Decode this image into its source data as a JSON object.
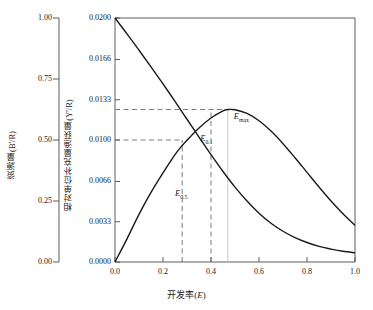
{
  "chart_data": {
    "type": "line",
    "title": "",
    "xlabel": "开发率(E)",
    "xlabel_plain": "开发率",
    "xlabel_symbol": "E",
    "ylabel_left": "资源量(B'/R)",
    "ylabel_right": "相对单位补充量渔获量(Y'/R)",
    "xlim": [
      0.0,
      1.0
    ],
    "ylim_left": [
      0.0,
      1.0
    ],
    "ylim_right": [
      0.0,
      0.02
    ],
    "xticks": [
      "0.0",
      "0.2",
      "0.4",
      "0.6",
      "0.8",
      "1.0"
    ],
    "xtick_values": [
      0.0,
      0.2,
      0.4,
      0.6,
      0.8,
      1.0
    ],
    "yticks_left": [
      "1.00",
      "0.75",
      "0.50",
      "0.25",
      "0.00"
    ],
    "ytick_values_left": [
      1.0,
      0.75,
      0.5,
      0.25,
      0.0
    ],
    "yticks_right": [
      "0.0200",
      "0.0166",
      "0.0133",
      "0.0100",
      "0.0066",
      "0.0033",
      "0.0000"
    ],
    "ytick_values_right": [
      0.02,
      0.0166,
      0.0133,
      0.01,
      0.0066,
      0.0033,
      0.0
    ],
    "grid": false,
    "legend": "none",
    "series": [
      {
        "name": "资源量(B'/R)",
        "axis": "left",
        "style": "solid",
        "color": "#1a1a1a",
        "x": [
          0.0,
          0.05,
          0.1,
          0.15,
          0.2,
          0.25,
          0.28,
          0.3,
          0.35,
          0.4,
          0.45,
          0.5,
          0.55,
          0.6,
          0.65,
          0.7,
          0.75,
          0.8,
          0.85,
          0.9,
          0.95,
          1.0
        ],
        "values": [
          1.0,
          0.935,
          0.868,
          0.8,
          0.73,
          0.658,
          0.614,
          0.585,
          0.512,
          0.44,
          0.371,
          0.307,
          0.25,
          0.2,
          0.159,
          0.126,
          0.1,
          0.08,
          0.064,
          0.053,
          0.044,
          0.038
        ]
      },
      {
        "name": "相对单位补充量渔获量(Y'/R)",
        "axis": "right",
        "style": "solid",
        "color": "#1a1a1a",
        "x": [
          0.0,
          0.05,
          0.1,
          0.15,
          0.2,
          0.25,
          0.28,
          0.3,
          0.35,
          0.4,
          0.45,
          0.47,
          0.5,
          0.55,
          0.6,
          0.65,
          0.7,
          0.75,
          0.8,
          0.85,
          0.9,
          0.95,
          1.0
        ],
        "values": [
          0.0,
          0.0019,
          0.0039,
          0.0057,
          0.0073,
          0.0088,
          0.00955,
          0.00998,
          0.01098,
          0.0118,
          0.01238,
          0.0125,
          0.01248,
          0.01218,
          0.01158,
          0.01073,
          0.0097,
          0.00855,
          0.00735,
          0.00615,
          0.005,
          0.00395,
          0.003
        ]
      }
    ],
    "annotations": [
      {
        "name": "E05",
        "label": "E",
        "sub": "0.5",
        "x": 0.28,
        "kind": "vertical-dashed",
        "text_x": 0.25,
        "text_y_right": 0.0056
      },
      {
        "name": "E01",
        "label": "E",
        "sub": "0.1",
        "x": 0.4,
        "kind": "vertical-dashed",
        "text_x": 0.355,
        "text_y_right": 0.0101
      },
      {
        "name": "Emax",
        "label": "E",
        "sub": "max",
        "x": 0.47,
        "kind": "vertical-dotted",
        "text_x": 0.495,
        "text_y_right": 0.0119
      }
    ],
    "reference_lines": [
      {
        "name": "E05-horizontal",
        "kind": "horizontal-dashed",
        "y_right": 0.01,
        "x_from": 0.0,
        "x_to": 0.28
      },
      {
        "name": "Emax-horizontal",
        "kind": "horizontal-dashed",
        "y_right": 0.0125,
        "x_from": 0.0,
        "x_to": 0.47
      },
      {
        "name": "E05-vertical",
        "kind": "vertical-dashed",
        "x": 0.28,
        "y_from": 0.0,
        "y_to": 0.01
      },
      {
        "name": "E01-vertical",
        "kind": "vertical-dashed",
        "x": 0.4,
        "y_from": 0.0,
        "y_to": 0.0125
      },
      {
        "name": "Emax-vertical",
        "kind": "vertical-dotted",
        "x": 0.47,
        "y_from": 0.0,
        "y_to": 0.0125
      }
    ]
  },
  "axes": {
    "left": {
      "title": "资源量(B'/R)",
      "ticks": [
        "1.00",
        "0.75",
        "0.50",
        "0.25",
        "0.00"
      ]
    },
    "right": {
      "title": "相对单位补充量渔获量(Y'/R)",
      "ticks": [
        "0.0200",
        "0.0166",
        "0.0133",
        "0.0100",
        "0.0066",
        "0.0033",
        "0.0000"
      ]
    },
    "bottom": {
      "title": "开发率(E)",
      "ticks": [
        "0.0",
        "0.2",
        "0.4",
        "0.6",
        "0.8",
        "1.0"
      ]
    }
  },
  "labels": {
    "e05": "E",
    "e05_sub": "0.5",
    "e01": "E",
    "e01_sub": "0.1",
    "emax": "E",
    "emax_sub": "max"
  }
}
